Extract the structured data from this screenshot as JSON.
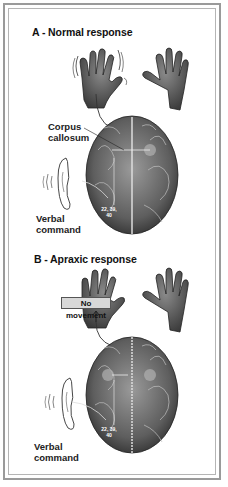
{
  "panels": [
    {
      "id": "A",
      "title": "A - Normal response",
      "labels": {
        "corpus_callosum_line1": "Corpus",
        "corpus_callosum_line2": "callosum",
        "verbal_line1": "Verbal",
        "verbal_line2": "command",
        "area_numbers_line1": "22, 39,",
        "area_numbers_line2": "40"
      },
      "hand_left_moving": true
    },
    {
      "id": "B",
      "title": "B - Apraxic response",
      "labels": {
        "no_movement": "No movement",
        "verbal_line1": "Verbal",
        "verbal_line2": "command",
        "area_numbers_line1": "22, 39,",
        "area_numbers_line2": "40"
      },
      "hand_left_moving": false
    }
  ],
  "colors": {
    "frame": "#9a9a9a",
    "ink": "#222222",
    "brain_fill": "#6a6a6a",
    "label_box": "#d8d8d8"
  }
}
